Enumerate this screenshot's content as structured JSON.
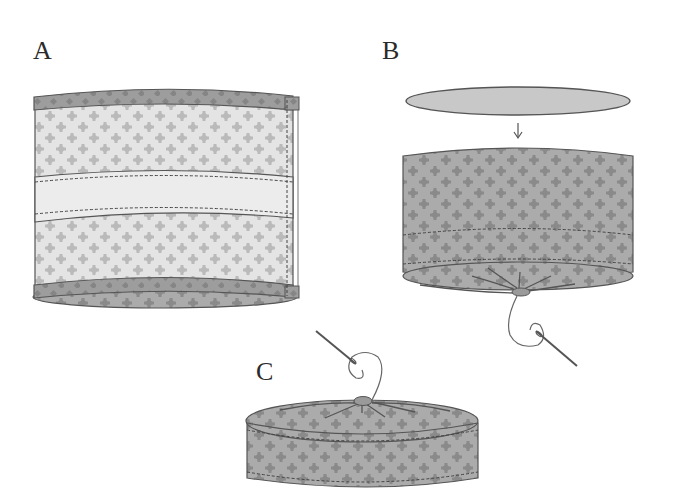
{
  "diagram": {
    "type": "sewing-instruction-steps",
    "steps": [
      {
        "id": "A",
        "label": "A",
        "description": "Cylinder band with bound top and bottom edges and plain middle band, side seam stitched"
      },
      {
        "id": "B",
        "label": "B",
        "description": "Oval top piece above patterned cylinder; arrow pointing down; bottom gathered with needle and thread"
      },
      {
        "id": "C",
        "label": "C",
        "description": "Short patterned cylinder with gathered top, needle and thread above"
      }
    ],
    "arrow_icon": "down-arrow",
    "colors": {
      "background": "#ffffff",
      "fabric_light": "#e4e4e4",
      "fabric_motif_light": "#b9b9b9",
      "fabric_dark": "#a9a9a9",
      "fabric_motif_dark": "#8c8c8c",
      "binding": "#9a9a9a",
      "plain_band": "#ececec",
      "oval_piece": "#c8c8c8",
      "outline": "#555555",
      "stitch": "#444444",
      "label_text": "#2a2a2a"
    }
  }
}
